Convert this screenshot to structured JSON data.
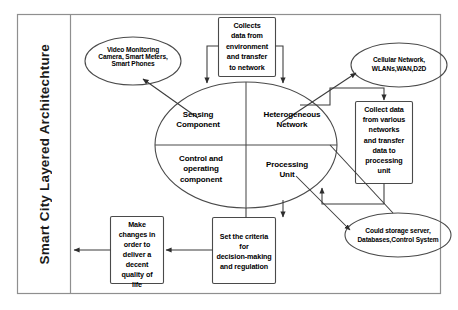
{
  "diagram": {
    "side_title": "Smart City Layered Architechture",
    "center": {
      "quadrants": [
        {
          "id": "sensing-component",
          "label": "Sensing\nComponent"
        },
        {
          "id": "heterogeneous-network",
          "label": "Heterogeneous\nNetwork"
        },
        {
          "id": "control-and-operating-component",
          "label": "Control and\noperating\ncomponent"
        },
        {
          "id": "processing-unit",
          "label": "Processing\nUnit"
        }
      ]
    },
    "ellipses": [
      {
        "id": "video-monitoring",
        "label": "Video Monitoring\nCamera, Smart Meters,\nSmart Phones"
      },
      {
        "id": "cellular-network",
        "label": "Cellular Network,\nWLANs,WAN,D2D"
      },
      {
        "id": "cloud-storage",
        "label": "Could storage server,\nDatabases,Control System"
      }
    ],
    "boxes": [
      {
        "id": "collects-data",
        "label": "Collects\ndata from\nenvironment\nand transfer\nto network"
      },
      {
        "id": "collect-various-networks",
        "label": "Collect data\nfrom various\nnetworks\nand transfer\ndata to\nprocessing\nunit"
      },
      {
        "id": "set-criteria",
        "label": "Set the criteria\nfor\ndecision-making\nand regulation"
      },
      {
        "id": "make-changes",
        "label": "Make\nchanges in\norder to\ndeliver a\ndecent\nquality of\nlife"
      }
    ],
    "colors": {
      "stroke": "#3a3a3a",
      "frame": "#8a8a8a",
      "text": "#000000",
      "background": "#ffffff"
    }
  }
}
